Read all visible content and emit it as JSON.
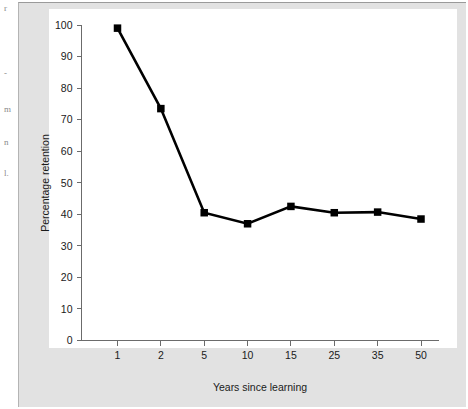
{
  "page": {
    "background_color": "#ffffff",
    "figure_background_color": "#e2e2e2",
    "plot_background_color": "#ffffff",
    "margin_fragments": [
      "r",
      "-",
      "m",
      "n",
      "l."
    ]
  },
  "chart_data": {
    "type": "line",
    "title": "",
    "subtitle": "",
    "xlabel": "Years since learning",
    "ylabel": "Percentage retention",
    "categories": [
      "1",
      "2",
      "5",
      "10",
      "15",
      "25",
      "35",
      "50"
    ],
    "values": [
      99,
      73.5,
      40.5,
      37,
      42.5,
      40.5,
      40.7,
      38.5
    ],
    "series": [
      {
        "name": "Percentage retention",
        "values": [
          99,
          73.5,
          40.5,
          37,
          42.5,
          40.5,
          40.7,
          38.5
        ]
      }
    ],
    "ylim": [
      0,
      100
    ],
    "yticks": [
      0,
      10,
      20,
      30,
      40,
      50,
      60,
      70,
      80,
      90,
      100
    ],
    "ytick_labels": [
      "0",
      "10",
      "20",
      "30",
      "40",
      "50",
      "60",
      "70",
      "80",
      "90",
      "100"
    ],
    "xtick_labels": [
      "1",
      "2",
      "5",
      "10",
      "15",
      "25",
      "35",
      "50"
    ],
    "grid": false,
    "legend": "none",
    "marker": "square",
    "line_color": "#000000",
    "marker_color": "#000000",
    "axis_color": "#6b6b6b"
  }
}
